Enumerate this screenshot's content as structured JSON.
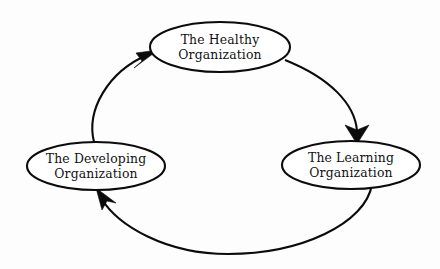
{
  "diagram": {
    "type": "cycle-diagram",
    "title": "",
    "direction": "clockwise",
    "background_color": "#fdfdfd",
    "line_color": "#0b0b0b",
    "node_fill_color": "#ffffff",
    "nodes": [
      {
        "id": "healthy",
        "label_line1": "The Healthy",
        "label_line2": "Organization",
        "position": "top",
        "cx": 220,
        "cy": 47,
        "rx": 70,
        "ry": 25
      },
      {
        "id": "learning",
        "label_line1": "The Learning",
        "label_line2": "Organization",
        "position": "right",
        "cx": 351,
        "cy": 165,
        "rx": 69,
        "ry": 24
      },
      {
        "id": "developing",
        "label_line1": "The Developing",
        "label_line2": "Organization",
        "position": "left",
        "cx": 96,
        "cy": 166,
        "rx": 69,
        "ry": 24
      }
    ],
    "edges": [
      {
        "id": "healthy-to-learning",
        "from": "healthy",
        "to": "learning",
        "arrow": "down",
        "arrow_tip_x": 357,
        "arrow_tip_y": 143
      },
      {
        "id": "learning-to-developing",
        "from": "learning",
        "to": "developing",
        "arrow": "up-left",
        "arrow_tip_x": 97,
        "arrow_tip_y": 189
      },
      {
        "id": "developing-to-healthy",
        "from": "developing",
        "to": "healthy",
        "arrow": "up-right",
        "arrow_tip_x": 158,
        "arrow_tip_y": 51
      }
    ]
  }
}
